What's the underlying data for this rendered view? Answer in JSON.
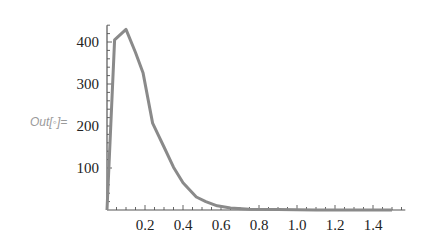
{
  "cell": {
    "out_label": "Out[◦]="
  },
  "colors": {
    "curve": "#8a8a8a",
    "axis": "#555555",
    "tick_label": "#222222",
    "out_label": "#9a9a9a"
  },
  "chart_data": {
    "type": "line",
    "title": "",
    "xlabel": "",
    "ylabel": "",
    "xlim": [
      0,
      1.57
    ],
    "ylim": [
      0,
      440
    ],
    "grid": false,
    "legend": null,
    "x_ticks": [
      0.2,
      0.4,
      0.6,
      0.8,
      1.0,
      1.2,
      1.4
    ],
    "x_tick_labels": [
      "0.2",
      "0.4",
      "0.6",
      "0.8",
      "1.0",
      "1.2",
      "1.4"
    ],
    "y_ticks": [
      100,
      200,
      300,
      400
    ],
    "y_tick_labels": [
      "100",
      "200",
      "300",
      "400"
    ],
    "series": [
      {
        "name": "curve",
        "x": [
          0.0,
          0.04,
          0.1,
          0.15,
          0.19,
          0.24,
          0.3,
          0.35,
          0.4,
          0.47,
          0.52,
          0.58,
          0.65,
          0.75,
          0.9,
          1.1,
          1.3,
          1.5
        ],
        "y": [
          0,
          405,
          430,
          375,
          326,
          207,
          150,
          102,
          65,
          31,
          20,
          10,
          5,
          2,
          1,
          0,
          0,
          0
        ]
      }
    ]
  }
}
